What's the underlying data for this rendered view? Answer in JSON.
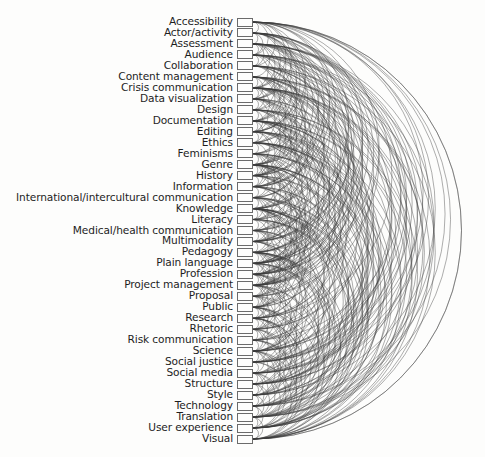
{
  "diagram": {
    "type": "arc-diagram",
    "nodes": [
      {
        "label": "Accessibility"
      },
      {
        "label": "Actor/activity"
      },
      {
        "label": "Assessment"
      },
      {
        "label": "Audience"
      },
      {
        "label": "Collaboration"
      },
      {
        "label": "Content management"
      },
      {
        "label": "Crisis communication"
      },
      {
        "label": "Data visualization"
      },
      {
        "label": "Design"
      },
      {
        "label": "Documentation"
      },
      {
        "label": "Editing"
      },
      {
        "label": "Ethics"
      },
      {
        "label": "Feminisms"
      },
      {
        "label": "Genre"
      },
      {
        "label": "History"
      },
      {
        "label": "Information"
      },
      {
        "label": "International/intercultural communication"
      },
      {
        "label": "Knowledge"
      },
      {
        "label": "Literacy"
      },
      {
        "label": "Medical/health communication"
      },
      {
        "label": "Multimodality"
      },
      {
        "label": "Pedagogy"
      },
      {
        "label": "Plain language"
      },
      {
        "label": "Profession"
      },
      {
        "label": "Project management"
      },
      {
        "label": "Proposal"
      },
      {
        "label": "Public"
      },
      {
        "label": "Research"
      },
      {
        "label": "Rhetoric"
      },
      {
        "label": "Risk communication"
      },
      {
        "label": "Science"
      },
      {
        "label": "Social justice"
      },
      {
        "label": "Social media"
      },
      {
        "label": "Structure"
      },
      {
        "label": "Style"
      },
      {
        "label": "Technology"
      },
      {
        "label": "Translation"
      },
      {
        "label": "User experience"
      },
      {
        "label": "Visual"
      }
    ],
    "edge_density": 0.62,
    "colors": {
      "edge": "#3a3a3a",
      "box_border": "#6b6b6b",
      "label": "#1e1e1e",
      "background": "#fdfdfc"
    }
  }
}
